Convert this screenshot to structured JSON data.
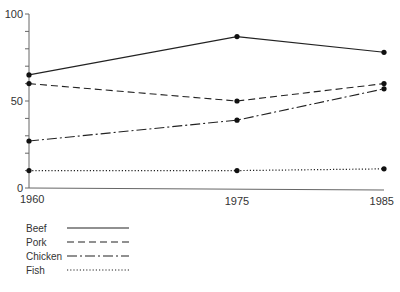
{
  "chart_data": {
    "type": "line",
    "title": "",
    "xlabel": "",
    "ylabel": "",
    "x": [
      "1960",
      "1975",
      "1985"
    ],
    "ylim": [
      0,
      100
    ],
    "yticks_labeled": [
      "0",
      "50",
      "100"
    ],
    "ytick_step": 10,
    "grid": false,
    "legend_position": "bottom-left",
    "series": [
      {
        "name": "Beef",
        "style": "solid",
        "values": [
          65,
          87,
          78
        ]
      },
      {
        "name": "Pork",
        "style": "dashed",
        "values": [
          60,
          50,
          60
        ]
      },
      {
        "name": "Chicken",
        "style": "dash-dot",
        "values": [
          27,
          39,
          57
        ]
      },
      {
        "name": "Fish",
        "style": "dotted",
        "values": [
          10,
          10,
          11
        ]
      }
    ]
  }
}
